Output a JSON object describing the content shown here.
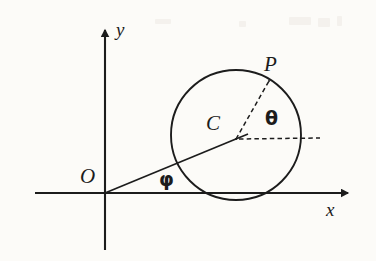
{
  "figure": {
    "background_color": "#fcfbf8",
    "stroke_color": "#1c1c1c",
    "width": 376,
    "height": 261
  },
  "axes": {
    "x_label": "x",
    "y_label": "y",
    "origin_label": "O",
    "x_axis": {
      "x_start": 35,
      "x_end": 355,
      "y": 193
    },
    "y_axis": {
      "x": 105,
      "y_start": 250,
      "y_end": 22
    },
    "origin": {
      "x": 105,
      "y": 193
    },
    "arrow_style": "solid filled triangle"
  },
  "circle": {
    "center_label": "C",
    "center": {
      "x": 236,
      "y": 135
    },
    "radius": 65,
    "stroke": "#1c1c1c",
    "fill": "none",
    "tangent_to": "x-axis"
  },
  "points": [
    {
      "name": "O",
      "label": "O",
      "x": 105,
      "y": 193,
      "description": "origin"
    },
    {
      "name": "C",
      "label": "C",
      "x": 236,
      "y": 139,
      "description": "circle center"
    },
    {
      "name": "P",
      "label": "P",
      "x": 268,
      "y": 82,
      "description": "point on circle"
    }
  ],
  "angles": [
    {
      "name": "phi",
      "label": "φ",
      "vertex": "O",
      "between": [
        "positive x-axis",
        "segment OC"
      ],
      "label_x": 166,
      "label_y": 181
    },
    {
      "name": "theta",
      "label": "θ",
      "vertex": "C",
      "between": [
        "horizontal dashed ray from C",
        "radius CP"
      ],
      "label_x": 272,
      "label_y": 120
    }
  ],
  "segments": [
    {
      "name": "OC",
      "style": "solid",
      "from": {
        "x": 105,
        "y": 193
      },
      "to": {
        "x": 247,
        "y": 134
      }
    },
    {
      "name": "CP",
      "style": "dashed",
      "from": {
        "x": 236,
        "y": 139
      },
      "to": {
        "x": 268,
        "y": 82
      }
    },
    {
      "name": "C-horizontal-ray",
      "style": "dashed",
      "from": {
        "x": 238,
        "y": 139
      },
      "to": {
        "x": 320,
        "y": 138
      }
    }
  ]
}
